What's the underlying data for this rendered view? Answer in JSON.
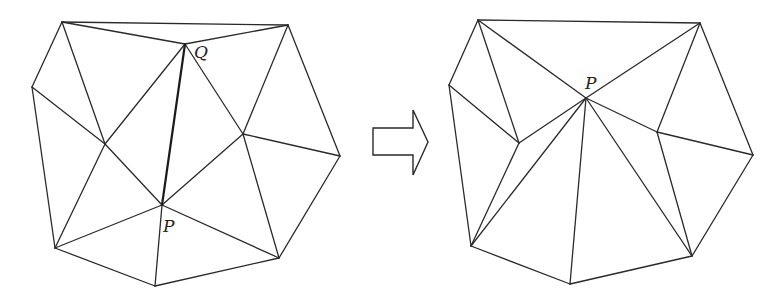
{
  "figure": {
    "colors": {
      "stroke": "#2a2a2a",
      "background": "#ffffff"
    }
  },
  "left": {
    "labels": {
      "P": "P",
      "Q": "Q"
    },
    "vertices": {
      "A": [
        62,
        22
      ],
      "B": [
        288,
        25
      ],
      "Q": [
        185,
        44
      ],
      "C": [
        32,
        87
      ],
      "D": [
        105,
        144
      ],
      "E": [
        243,
        134
      ],
      "F": [
        340,
        156
      ],
      "P": [
        162,
        205
      ],
      "G": [
        55,
        248
      ],
      "H": [
        155,
        286
      ],
      "I": [
        279,
        258
      ]
    },
    "edges": [
      [
        "A",
        "B"
      ],
      [
        "A",
        "Q"
      ],
      [
        "A",
        "C"
      ],
      [
        "A",
        "D"
      ],
      [
        "Q",
        "B"
      ],
      [
        "Q",
        "D"
      ],
      [
        "Q",
        "E"
      ],
      [
        "B",
        "E"
      ],
      [
        "B",
        "F"
      ],
      [
        "C",
        "D"
      ],
      [
        "C",
        "G"
      ],
      [
        "D",
        "P"
      ],
      [
        "D",
        "G"
      ],
      [
        "P",
        "E"
      ],
      [
        "P",
        "G"
      ],
      [
        "P",
        "H"
      ],
      [
        "P",
        "I"
      ],
      [
        "E",
        "F"
      ],
      [
        "E",
        "I"
      ],
      [
        "F",
        "I"
      ],
      [
        "G",
        "H"
      ],
      [
        "H",
        "I"
      ]
    ],
    "highlighted_edge": [
      "Q",
      "P"
    ]
  },
  "arrow": {
    "direction": "right",
    "icon": "hollow-arrow-right"
  },
  "right": {
    "labels": {
      "P": "P"
    },
    "vertices": {
      "A": [
        478,
        20
      ],
      "B": [
        700,
        23
      ],
      "C": [
        449,
        85
      ],
      "D": [
        519,
        143
      ],
      "P": [
        586,
        98
      ],
      "E": [
        657,
        132
      ],
      "F": [
        753,
        155
      ],
      "G": [
        471,
        246
      ],
      "H": [
        570,
        284
      ],
      "I": [
        692,
        256
      ]
    },
    "edges": [
      [
        "A",
        "B"
      ],
      [
        "A",
        "C"
      ],
      [
        "A",
        "D"
      ],
      [
        "A",
        "P"
      ],
      [
        "B",
        "P"
      ],
      [
        "B",
        "E"
      ],
      [
        "B",
        "F"
      ],
      [
        "C",
        "D"
      ],
      [
        "C",
        "G"
      ],
      [
        "D",
        "P"
      ],
      [
        "D",
        "G"
      ],
      [
        "P",
        "G"
      ],
      [
        "P",
        "H"
      ],
      [
        "P",
        "I"
      ],
      [
        "P",
        "E"
      ],
      [
        "E",
        "F"
      ],
      [
        "E",
        "I"
      ],
      [
        "F",
        "I"
      ],
      [
        "G",
        "H"
      ],
      [
        "H",
        "I"
      ]
    ]
  }
}
